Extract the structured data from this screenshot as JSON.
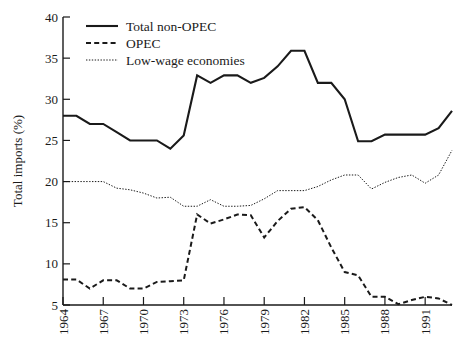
{
  "chart_data": {
    "type": "line",
    "title": "",
    "xlabel": "",
    "ylabel": "Total imports (%)",
    "xlim": [
      1964,
      1993
    ],
    "ylim": [
      5,
      40
    ],
    "grid": false,
    "legend_position": "top-left",
    "x_tick_labels": [
      "1964",
      "1967",
      "1970",
      "1973",
      "1976",
      "1979",
      "1982",
      "1985",
      "1988",
      "1991"
    ],
    "x_tick_values": [
      1964,
      1967,
      1970,
      1973,
      1976,
      1979,
      1982,
      1985,
      1988,
      1991
    ],
    "y_tick_labels": [
      "5",
      "10",
      "15",
      "20",
      "25",
      "30",
      "35",
      "40"
    ],
    "y_tick_values": [
      5,
      10,
      15,
      20,
      25,
      30,
      35,
      40
    ],
    "x": [
      1964,
      1965,
      1966,
      1967,
      1968,
      1969,
      1970,
      1971,
      1972,
      1973,
      1974,
      1975,
      1976,
      1977,
      1978,
      1979,
      1980,
      1981,
      1982,
      1983,
      1984,
      1985,
      1986,
      1987,
      1988,
      1989,
      1990,
      1991,
      1992,
      1993
    ],
    "series": [
      {
        "name": "Total non-OPEC",
        "style": "solid",
        "color": "#1a1a1a",
        "values": [
          28.0,
          28.0,
          27.0,
          27.0,
          26.0,
          25.0,
          25.0,
          25.0,
          24.0,
          25.6,
          32.9,
          32.0,
          32.9,
          32.9,
          32.0,
          32.6,
          34.0,
          35.9,
          35.9,
          32.0,
          32.0,
          30.0,
          24.9,
          24.9,
          25.7,
          25.7,
          25.7,
          25.7,
          26.5,
          28.6
        ]
      },
      {
        "name": "OPEC",
        "style": "dashed",
        "color": "#1a1a1a",
        "values": [
          8.1,
          8.1,
          7.0,
          8.0,
          8.0,
          7.0,
          7.0,
          7.8,
          7.9,
          8.0,
          16.0,
          14.9,
          15.4,
          16.0,
          15.9,
          13.2,
          15.2,
          16.7,
          16.9,
          15.3,
          12.0,
          9.0,
          8.6,
          6.0,
          6.0,
          5.1,
          5.6,
          6.0,
          5.8,
          5.0
        ]
      },
      {
        "name": "Low-wage economies",
        "style": "dotted",
        "color": "#1a1a1a",
        "values": [
          20.0,
          20.0,
          20.0,
          20.0,
          19.2,
          19.0,
          18.6,
          18.0,
          18.1,
          17.0,
          17.0,
          17.8,
          17.0,
          17.0,
          17.1,
          17.9,
          18.9,
          18.9,
          18.9,
          19.4,
          20.2,
          20.8,
          20.8,
          19.1,
          19.9,
          20.5,
          20.8,
          19.8,
          20.8,
          23.8
        ]
      }
    ]
  },
  "legend": {
    "entries": [
      {
        "label": "Total non-OPEC",
        "style": "solid"
      },
      {
        "label": "OPEC",
        "style": "dashed"
      },
      {
        "label": "Low-wage economies",
        "style": "dotted"
      }
    ]
  }
}
